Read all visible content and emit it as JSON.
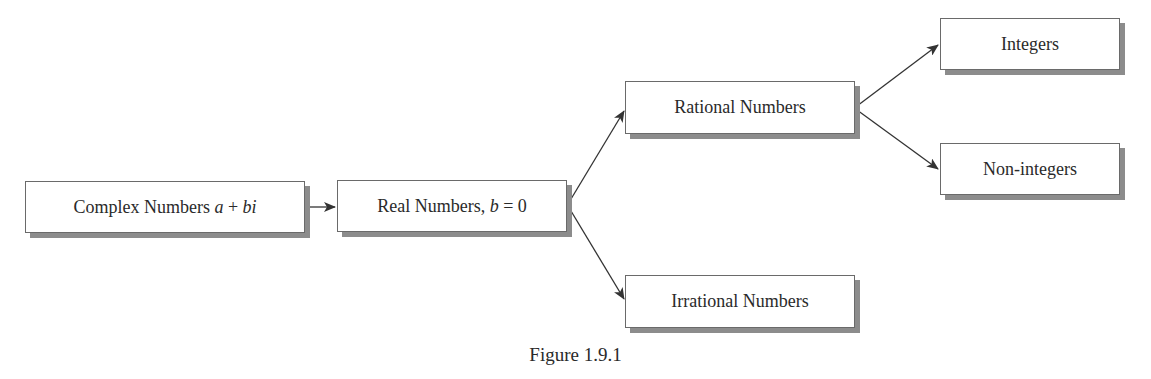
{
  "diagram": {
    "type": "tree",
    "nodes": [
      {
        "id": "complex",
        "label": "Complex Numbers",
        "math": "a + bi"
      },
      {
        "id": "real",
        "label": "Real Numbers,",
        "math": "b",
        "math_suffix": "= 0"
      },
      {
        "id": "rational",
        "label": "Rational Numbers"
      },
      {
        "id": "irrational",
        "label": "Irrational Numbers"
      },
      {
        "id": "integers",
        "label": "Integers"
      },
      {
        "id": "non_integers",
        "label": "Non-integers"
      }
    ],
    "edges": [
      {
        "from": "complex",
        "to": "real"
      },
      {
        "from": "real",
        "to": "rational"
      },
      {
        "from": "real",
        "to": "irrational"
      },
      {
        "from": "rational",
        "to": "integers"
      },
      {
        "from": "rational",
        "to": "non_integers"
      }
    ],
    "caption": "Figure 1.9.1"
  },
  "labels": {
    "complex_text": "Complex Numbers ",
    "complex_math_a": "a",
    "complex_math_plus": " + ",
    "complex_math_bi": "bi",
    "real_text": "Real Numbers, ",
    "real_math_b": "b",
    "real_eq": " = 0",
    "rational": "Rational Numbers",
    "irrational": "Irrational Numbers",
    "integers": "Integers",
    "non_integers": "Non-integers",
    "caption": "Figure 1.9.1"
  },
  "colors": {
    "border": "#6a6a6a",
    "shadow": "#8c8c8c",
    "text": "#2a2a2a",
    "line": "#333333"
  }
}
